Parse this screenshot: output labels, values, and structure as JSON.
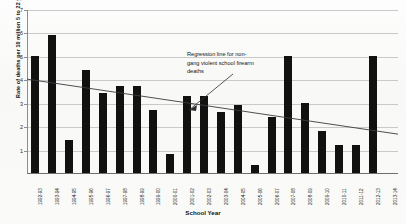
{
  "chart_data": {
    "type": "bar",
    "title": "",
    "xlabel": "School Year",
    "ylabel": "Rate of deaths per 10 million 5 to 22 year olds",
    "ylim": [
      0,
      7
    ],
    "yticks": [
      1,
      2,
      3,
      4,
      5,
      6,
      7
    ],
    "grid": true,
    "legend": "none",
    "categories": [
      "1992-93",
      "1993-94",
      "1994-95",
      "1995-96",
      "1996-97",
      "1997-98",
      "1998-99",
      "1999-00",
      "2000-01",
      "2001-02",
      "2002-03",
      "2003-04",
      "2004-05",
      "2005-06",
      "2006-07",
      "2007-08",
      "2008-09",
      "2009-10",
      "2010-11",
      "2011-12",
      "2012-13",
      "2013-14"
    ],
    "values": [
      5.0,
      5.9,
      1.4,
      4.4,
      3.4,
      3.7,
      3.7,
      2.7,
      0.8,
      3.3,
      3.3,
      2.6,
      2.9,
      0.35,
      2.4,
      5.0,
      3.0,
      1.8,
      1.2,
      1.2,
      5.0,
      0.0
    ],
    "series": [
      {
        "name": "Non-gang violent school firearm death rate",
        "values": [
          5.0,
          5.9,
          1.4,
          4.4,
          3.4,
          3.7,
          3.7,
          2.7,
          0.8,
          3.3,
          3.3,
          2.6,
          2.9,
          0.35,
          2.4,
          5.0,
          3.0,
          1.8,
          1.2,
          1.2,
          5.0,
          0.0
        ],
        "color": "#111111"
      }
    ],
    "trendline": {
      "label": "Regression line for non-gang violent school firearm deaths",
      "y_start": 4.05,
      "y_end": 1.7,
      "color": "#3b3b3b"
    },
    "annotations": [
      {
        "text": "Regression line for non-gang violent school firearm deaths",
        "points_to": "trendline"
      }
    ],
    "bar_color": "#111111",
    "gridline_color": "#c9c9c9",
    "axis_color": "#8d8d8d"
  },
  "axes": {
    "y_title": "Rate of deaths per 10 million 5 to 22 year olds",
    "x_title": "School Year",
    "y_tick_labels": [
      "1",
      "2",
      "3",
      "4",
      "5",
      "6",
      "7"
    ]
  },
  "annotation": {
    "line1": "Regression line for non-",
    "line2": "gang violent school firearm",
    "line3": "deaths",
    "full": "Regression line for non-gang violent school firearm deaths"
  }
}
